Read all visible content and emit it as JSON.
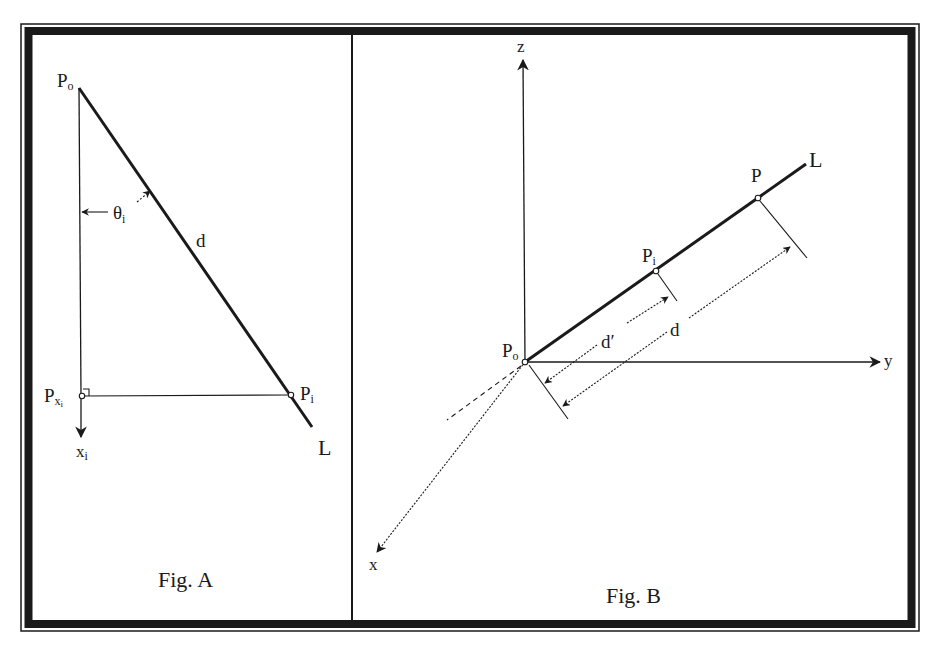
{
  "figure_a": {
    "caption": "Fig. A",
    "labels": {
      "p0": "P",
      "p0_sub": "o",
      "theta": "θ",
      "theta_sub": "i",
      "d": "d",
      "pi": "P",
      "pi_sub": "i",
      "pxi": "P",
      "pxi_sub": "x",
      "pxi_subsub": "i",
      "xi": "x",
      "xi_sub": "i",
      "line": "L"
    }
  },
  "figure_b": {
    "caption": "Fig. B",
    "axes": {
      "x": "x",
      "y": "y",
      "z": "z"
    },
    "labels": {
      "p0": "P",
      "p0_sub": "o",
      "pi": "P",
      "pi_sub": "i",
      "p": "P",
      "line": "L",
      "d_prime": "d′",
      "d": "d"
    }
  },
  "colors": {
    "ink": "#1a1a1a",
    "background": "#ffffff"
  }
}
